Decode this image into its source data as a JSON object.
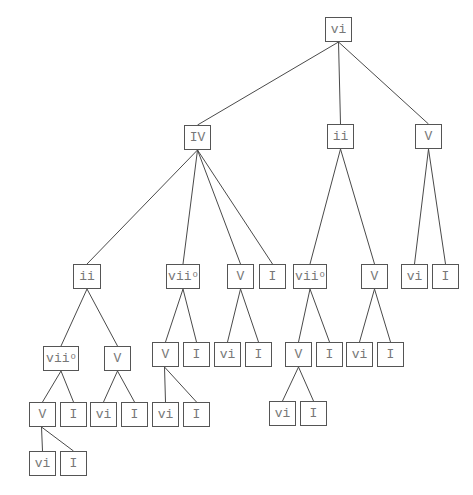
{
  "diagram": {
    "type": "tree",
    "colors": {
      "line": "#4a4a4a",
      "border": "#555555",
      "text": "#777777",
      "background": "#ffffff"
    },
    "nodes": [
      {
        "id": "n0",
        "label": "vi",
        "sup": "",
        "x": 325,
        "y": 17,
        "w": 27
      },
      {
        "id": "n1",
        "label": "IV",
        "sup": "",
        "x": 184,
        "y": 125,
        "w": 27,
        "parent": "n0"
      },
      {
        "id": "n2",
        "label": "ii",
        "sup": "",
        "x": 327,
        "y": 124,
        "w": 27,
        "parent": "n0"
      },
      {
        "id": "n3",
        "label": "V",
        "sup": "",
        "x": 415,
        "y": 124,
        "w": 27,
        "parent": "n0"
      },
      {
        "id": "n4",
        "label": "ii",
        "sup": "",
        "x": 73,
        "y": 264,
        "w": 28,
        "parent": "n1"
      },
      {
        "id": "n5",
        "label": "vii",
        "sup": "o",
        "x": 166,
        "y": 264,
        "w": 34,
        "parent": "n1"
      },
      {
        "id": "n6",
        "label": "V",
        "sup": "",
        "x": 227,
        "y": 264,
        "w": 27,
        "parent": "n1"
      },
      {
        "id": "n7",
        "label": "I",
        "sup": "",
        "x": 259,
        "y": 264,
        "w": 27,
        "parent": "n1"
      },
      {
        "id": "n8",
        "label": "vii",
        "sup": "o",
        "x": 293,
        "y": 264,
        "w": 34,
        "parent": "n2"
      },
      {
        "id": "n9",
        "label": "V",
        "sup": "",
        "x": 361,
        "y": 264,
        "w": 27,
        "parent": "n2"
      },
      {
        "id": "n10",
        "label": "vi",
        "sup": "",
        "x": 401,
        "y": 264,
        "w": 27,
        "parent": "n3"
      },
      {
        "id": "n11",
        "label": "I",
        "sup": "",
        "x": 432,
        "y": 264,
        "w": 27,
        "parent": "n3"
      },
      {
        "id": "n12",
        "label": "vii",
        "sup": "o",
        "x": 43,
        "y": 346,
        "w": 36,
        "parent": "n4"
      },
      {
        "id": "n13",
        "label": "V",
        "sup": "",
        "x": 104,
        "y": 346,
        "w": 27,
        "parent": "n4"
      },
      {
        "id": "n14",
        "label": "V",
        "sup": "",
        "x": 152,
        "y": 342,
        "w": 27,
        "parent": "n5"
      },
      {
        "id": "n15",
        "label": "I",
        "sup": "",
        "x": 183,
        "y": 342,
        "w": 27,
        "parent": "n5"
      },
      {
        "id": "n16",
        "label": "vi",
        "sup": "",
        "x": 214,
        "y": 342,
        "w": 27,
        "parent": "n6"
      },
      {
        "id": "n17",
        "label": "I",
        "sup": "",
        "x": 245,
        "y": 342,
        "w": 27,
        "parent": "n6"
      },
      {
        "id": "n18",
        "label": "V",
        "sup": "",
        "x": 285,
        "y": 342,
        "w": 27,
        "parent": "n8"
      },
      {
        "id": "n19",
        "label": "I",
        "sup": "",
        "x": 316,
        "y": 342,
        "w": 27,
        "parent": "n8"
      },
      {
        "id": "n20",
        "label": "vi",
        "sup": "",
        "x": 346,
        "y": 342,
        "w": 27,
        "parent": "n9"
      },
      {
        "id": "n21",
        "label": "I",
        "sup": "",
        "x": 377,
        "y": 342,
        "w": 27,
        "parent": "n9"
      },
      {
        "id": "n22",
        "label": "V",
        "sup": "",
        "x": 29,
        "y": 402,
        "w": 27,
        "parent": "n12"
      },
      {
        "id": "n23",
        "label": "I",
        "sup": "",
        "x": 60,
        "y": 402,
        "w": 27,
        "parent": "n12"
      },
      {
        "id": "n24",
        "label": "vi",
        "sup": "",
        "x": 90,
        "y": 402,
        "w": 27,
        "parent": "n13"
      },
      {
        "id": "n25",
        "label": "I",
        "sup": "",
        "x": 121,
        "y": 402,
        "w": 27,
        "parent": "n13"
      },
      {
        "id": "n26",
        "label": "vi",
        "sup": "",
        "x": 152,
        "y": 402,
        "w": 27,
        "parent": "n14",
        "edge_from": "left"
      },
      {
        "id": "n27",
        "label": "I",
        "sup": "",
        "x": 183,
        "y": 402,
        "w": 27,
        "parent": "n14",
        "edge_from": "left"
      },
      {
        "id": "n28",
        "label": "vi",
        "sup": "",
        "x": 269,
        "y": 401,
        "w": 27,
        "parent": "n18"
      },
      {
        "id": "n29",
        "label": "I",
        "sup": "",
        "x": 300,
        "y": 401,
        "w": 27,
        "parent": "n18"
      },
      {
        "id": "n30",
        "label": "vi",
        "sup": "",
        "x": 29,
        "y": 451,
        "w": 27,
        "parent": "n22",
        "edge_from": "left"
      },
      {
        "id": "n31",
        "label": "I",
        "sup": "",
        "x": 60,
        "y": 451,
        "w": 27,
        "parent": "n22",
        "edge_from": "left"
      }
    ]
  }
}
